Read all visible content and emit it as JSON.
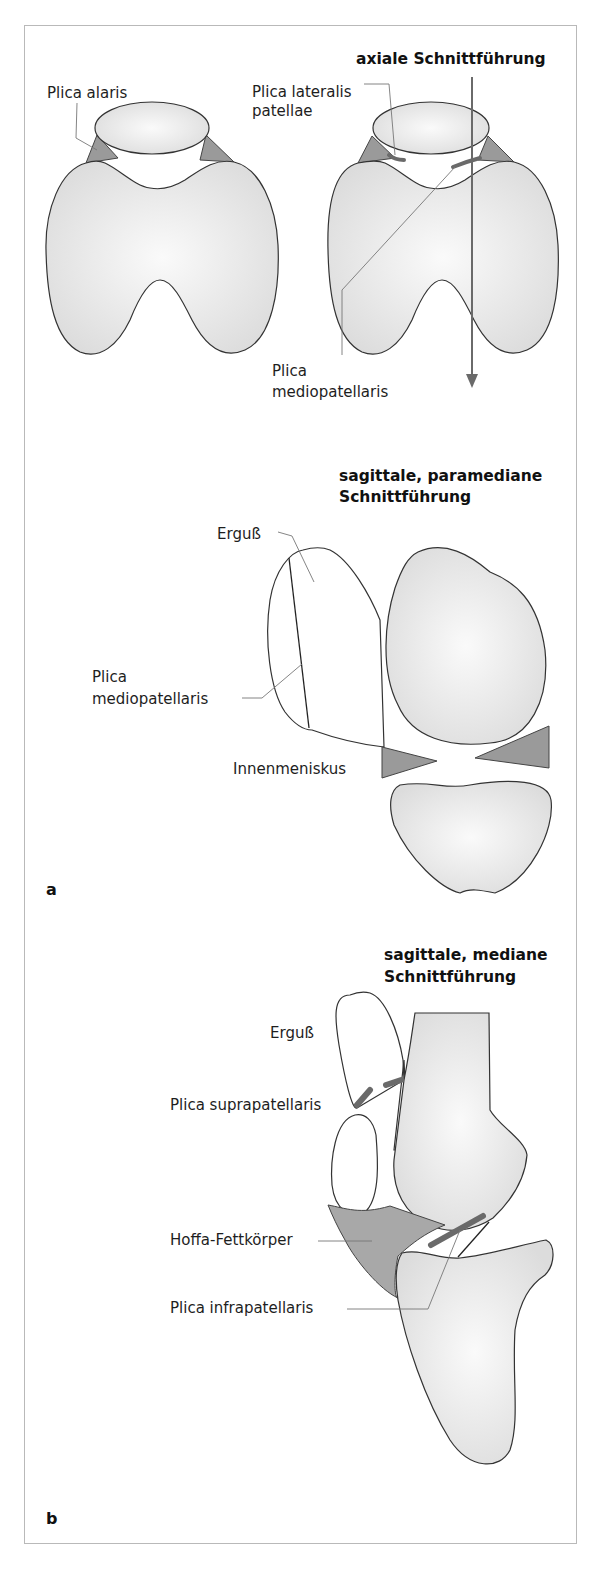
{
  "figure": {
    "panel_labels": [
      "a",
      "b"
    ],
    "axial": {
      "heading": "axiale Schnittführung",
      "labels": {
        "plica_alaris": "Plica alaris",
        "plica_lateralis_line1": "Plica lateralis",
        "plica_lateralis_line2": "patellae",
        "plica_medio_line1": "Plica",
        "plica_medio_line2": "mediopatellaris"
      }
    },
    "sagittal_paramedian": {
      "heading_line1": "sagittale, paramediane",
      "heading_line2": "Schnittführung",
      "labels": {
        "erguss": "Erguß",
        "plica_medio_line1": "Plica",
        "plica_medio_line2": "mediopatellaris",
        "innenmeniskus": "Innenmeniskus"
      }
    },
    "sagittal_median": {
      "heading_line1": "sagittale, mediane",
      "heading_line2": "Schnittführung",
      "labels": {
        "erguss": "Erguß",
        "plica_supra": "Plica suprapatellaris",
        "hoffa": "Hoffa-Fettkörper",
        "plica_infra": "Plica infrapatellaris"
      }
    },
    "colors": {
      "bone_fill": "#e6e6e6",
      "meniscus_fill": "#9a9a9a",
      "plica_stroke": "#6a6a6a",
      "frame": "#b9b9b9"
    }
  }
}
